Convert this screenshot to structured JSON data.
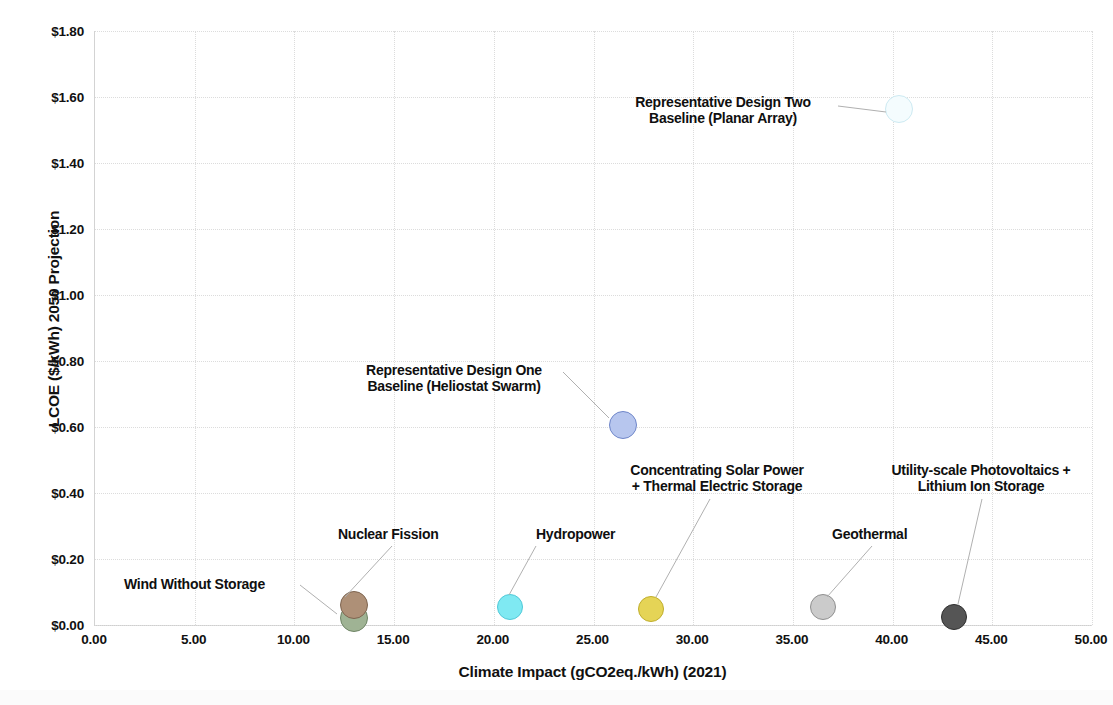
{
  "chart_data": {
    "type": "scatter",
    "title": "",
    "xlabel": "Climate Impact (gCO2eq./kWh) (2021)",
    "ylabel": "LCOE ($/kWh) 2050 Projection",
    "xlim": [
      0,
      50
    ],
    "ylim": [
      0,
      1.8
    ],
    "xticks": [
      "0.00",
      "5.00",
      "10.00",
      "15.00",
      "20.00",
      "25.00",
      "30.00",
      "35.00",
      "40.00",
      "45.00",
      "50.00"
    ],
    "xtick_values": [
      0,
      5,
      10,
      15,
      20,
      25,
      30,
      35,
      40,
      45,
      50
    ],
    "yticks": [
      "$0.00",
      "$0.20",
      "$0.40",
      "$0.60",
      "$0.80",
      "$1.00",
      "$1.20",
      "$1.40",
      "$1.60",
      "$1.80"
    ],
    "ytick_values": [
      0,
      0.2,
      0.4,
      0.6,
      0.8,
      1.0,
      1.2,
      1.4,
      1.6,
      1.8
    ],
    "grid": true,
    "legend": "none (direct point labels with leader lines)",
    "points": [
      {
        "label": "Wind Without Storage",
        "x": 13.0,
        "y": 0.02,
        "color": "#9FB394",
        "edge": "#6F8566",
        "radius": 14,
        "label_x": 124,
        "label_y": 576,
        "label_align": "left",
        "leader": [
          [
            300,
            585
          ],
          [
            337,
            614
          ]
        ]
      },
      {
        "label": "Nuclear Fission",
        "x": 13.0,
        "y": 0.06,
        "color": "#AE9077",
        "edge": "#7E6550",
        "radius": 14,
        "label_x": 338,
        "label_y": 526,
        "label_align": "left",
        "leader": [
          [
            392,
            546
          ],
          [
            345,
            597
          ]
        ]
      },
      {
        "label": "Hydropower",
        "x": 20.8,
        "y": 0.055,
        "color": "#7FE9F2",
        "edge": "#4FC9D8",
        "radius": 13,
        "label_x": 536,
        "label_y": 526,
        "label_align": "left",
        "leader": [
          [
            536,
            546
          ],
          [
            509,
            595
          ]
        ]
      },
      {
        "label": "Concentrating Solar Power\n+ Thermal Electric Storage",
        "x": 27.9,
        "y": 0.048,
        "color": "#E5D456",
        "edge": "#C0AE2C",
        "radius": 13,
        "label_x": 613,
        "label_y": 462,
        "label_align": "center",
        "label_width": 208,
        "leader": [
          [
            710,
            499
          ],
          [
            656,
            597
          ]
        ]
      },
      {
        "label": "Geothermal",
        "x": 36.5,
        "y": 0.055,
        "color": "#CBCBCB",
        "edge": "#8F8F8F",
        "radius": 13,
        "label_x": 832,
        "label_y": 526,
        "label_align": "left",
        "leader": [
          [
            872,
            546
          ],
          [
            827,
            597
          ]
        ]
      },
      {
        "label": "Utility-scale Photovoltaics +\nLithium Ion Storage",
        "x": 43.1,
        "y": 0.025,
        "color": "#555555",
        "edge": "#2E2E2E",
        "radius": 13,
        "label_x": 876,
        "label_y": 462,
        "label_align": "center",
        "label_width": 210,
        "leader": [
          [
            982,
            499
          ],
          [
            958,
            604
          ]
        ]
      },
      {
        "label": "Representative Design One\nBaseline (Heliostat Swarm)",
        "x": 26.5,
        "y": 0.605,
        "color": "#B7C6EE",
        "edge": "#6F86C9",
        "radius": 14,
        "label_x": 348,
        "label_y": 362,
        "label_align": "center",
        "label_width": 212,
        "leader": [
          [
            563,
            372
          ],
          [
            609,
            418
          ]
        ]
      },
      {
        "label": "Representative Design Two\nBaseline (Planar Array)",
        "x": 40.3,
        "y": 1.565,
        "color": "#F4FCFE",
        "edge": "#CDEAF2",
        "radius": 14,
        "label_x": 615,
        "label_y": 94,
        "label_align": "center",
        "label_width": 216,
        "leader": [
          [
            838,
            106
          ],
          [
            886,
            112
          ]
        ]
      }
    ]
  }
}
